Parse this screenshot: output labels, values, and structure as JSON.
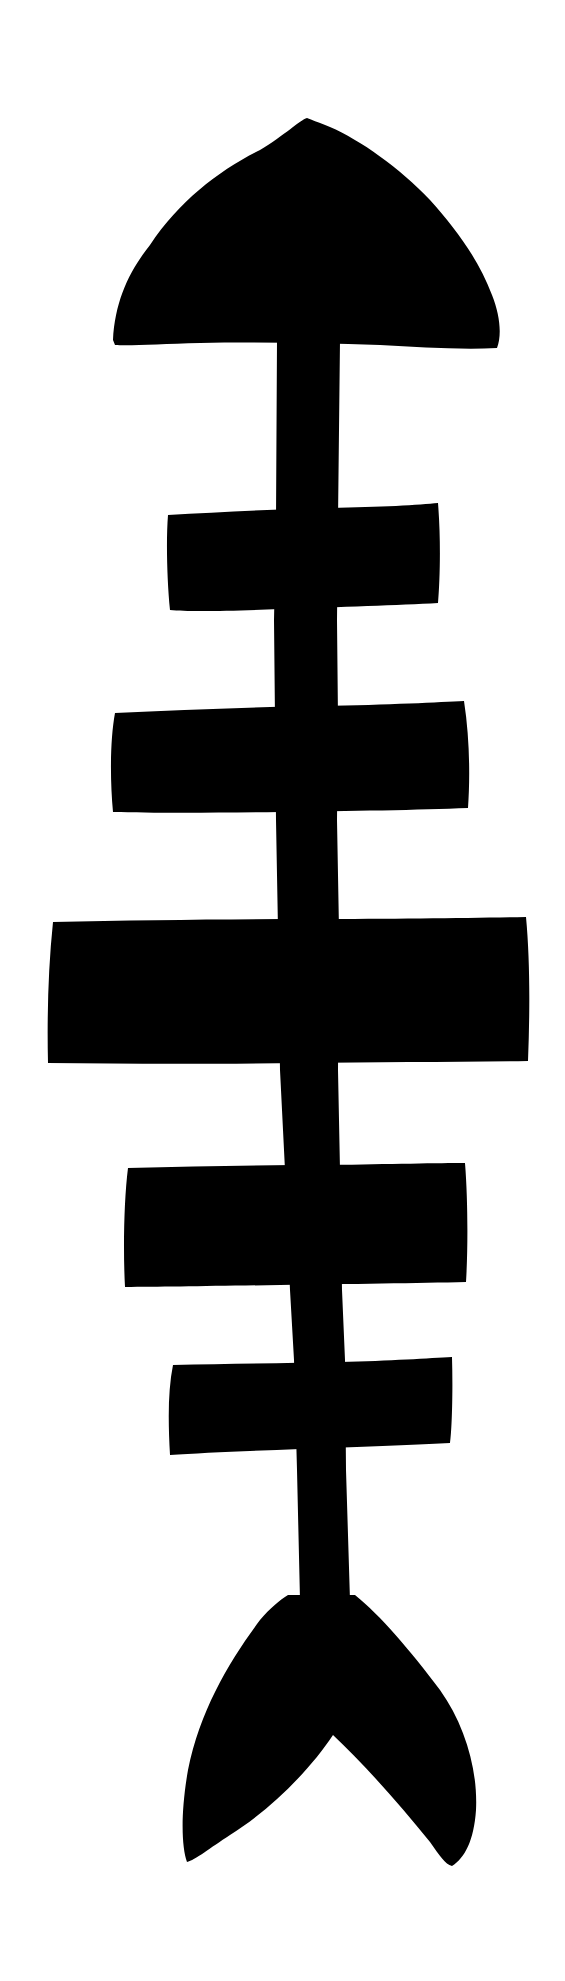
{
  "figure": {
    "title": "Fish skeleton silhouette",
    "background_color": "#ffffff",
    "fill_color": "#000000",
    "parts": {
      "head": "head",
      "spine": "spine",
      "ribs": [
        "rib-1",
        "rib-2",
        "rib-3",
        "rib-4",
        "rib-5"
      ],
      "tail": "tail"
    }
  }
}
